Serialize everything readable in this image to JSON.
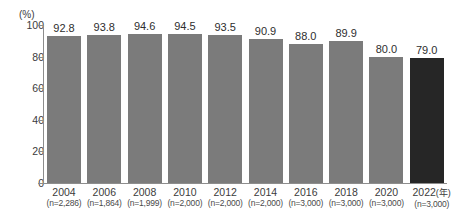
{
  "chart_data": {
    "type": "bar",
    "title": "",
    "xlabel": "",
    "ylabel": "(%)",
    "unit_label": "(%)",
    "year_axis_suffix": "(年)",
    "ylim": [
      0,
      100
    ],
    "yticks": [
      100,
      80,
      60,
      40,
      20,
      0
    ],
    "ytick_labels": [
      "100",
      "80",
      "60",
      "40",
      "20",
      "0"
    ],
    "grid": false,
    "legend": "none",
    "categories": [
      "2004",
      "2006",
      "2008",
      "2010",
      "2012",
      "2014",
      "2016",
      "2018",
      "2020",
      "2022"
    ],
    "values": [
      92.8,
      93.8,
      94.6,
      94.5,
      93.5,
      90.9,
      88.0,
      89.9,
      80.0,
      79.0
    ],
    "value_labels": [
      "92.8",
      "93.8",
      "94.6",
      "94.5",
      "93.5",
      "90.9",
      "88.0",
      "89.9",
      "80.0",
      "79.0"
    ],
    "sample_sizes": [
      "(n=2,286)",
      "(n=1,864)",
      "(n=1,999)",
      "(n=2,000)",
      "(n=2,000)",
      "(n=2,000)",
      "(n=3,000)",
      "(n=3,000)",
      "(n=3,000)",
      "(n=3,000)"
    ],
    "bar_colors": [
      "#7b7b7b",
      "#7b7b7b",
      "#7b7b7b",
      "#7b7b7b",
      "#7b7b7b",
      "#7b7b7b",
      "#7b7b7b",
      "#7b7b7b",
      "#7b7b7b",
      "#262626"
    ],
    "highlight_index": 9,
    "colors": {
      "bar_default": "#7b7b7b",
      "bar_highlight": "#262626",
      "axis": "#8d8d8d",
      "text": "#3b3b3b",
      "background": "#ffffff"
    }
  }
}
